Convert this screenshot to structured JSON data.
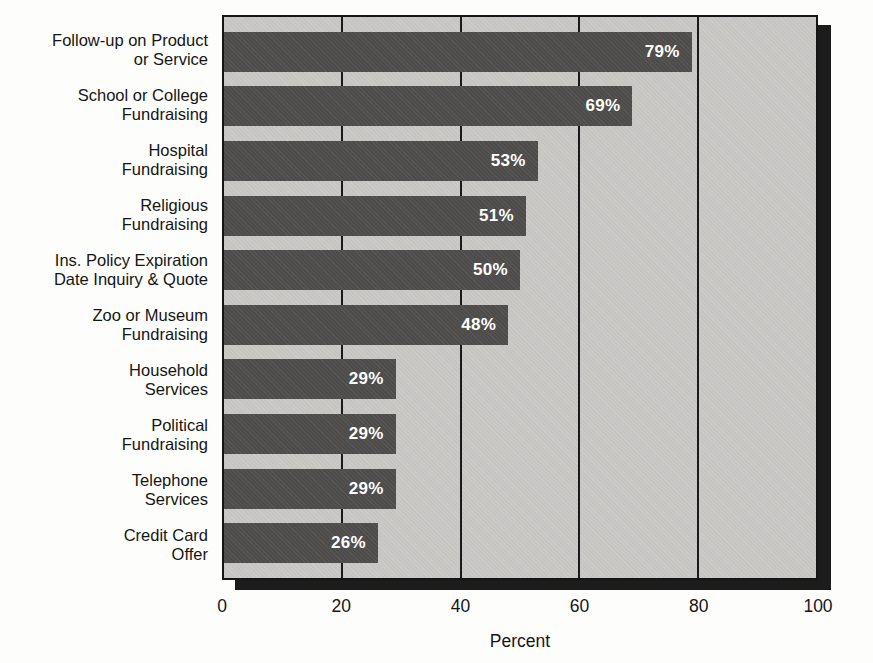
{
  "chart_data": {
    "type": "bar",
    "orientation": "horizontal",
    "title": "",
    "xlabel": "Percent",
    "ylabel": "",
    "xlim": [
      0,
      100
    ],
    "grid": "vertical gridlines at 20, 40, 60, 80 drawn behind bars",
    "x_ticks": {
      "t0": "0",
      "t1": "20",
      "t2": "40",
      "t3": "60",
      "t4": "80",
      "t5": "100"
    },
    "bars": [
      {
        "label": "Follow-up on Product\nor Service",
        "value": 79,
        "display": "79%"
      },
      {
        "label": "School or College\nFundraising",
        "value": 69,
        "display": "69%"
      },
      {
        "label": "Hospital\nFundraising",
        "value": 53,
        "display": "53%"
      },
      {
        "label": "Religious\nFundraising",
        "value": 51,
        "display": "51%"
      },
      {
        "label": "Ins. Policy Expiration\nDate Inquiry & Quote",
        "value": 50,
        "display": "50%"
      },
      {
        "label": "Zoo or Museum\nFundraising",
        "value": 48,
        "display": "48%"
      },
      {
        "label": "Household\nServices",
        "value": 29,
        "display": "29%"
      },
      {
        "label": "Political\nFundraising",
        "value": 29,
        "display": "29%"
      },
      {
        "label": "Telephone\nServices",
        "value": 29,
        "display": "29%"
      },
      {
        "label": "Credit Card\nOffer",
        "value": 26,
        "display": "26%"
      }
    ],
    "colors": {
      "bar_fill": "#4d4c4a",
      "plot_background": "#c6c5c2",
      "plot_border": "#151515",
      "drop_shadow": "#1c1c1c",
      "value_text": "#ffffff",
      "label_text": "#161616",
      "page_background": "#fdfdfb"
    }
  }
}
